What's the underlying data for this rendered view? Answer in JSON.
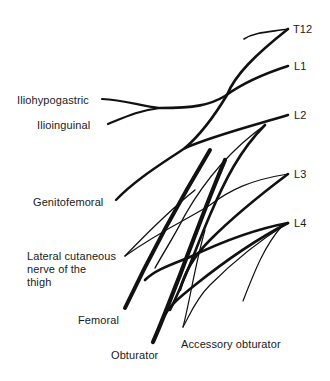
{
  "diagram": {
    "roots": [
      {
        "id": "t12",
        "label": "T12"
      },
      {
        "id": "l1",
        "label": "L1"
      },
      {
        "id": "l2",
        "label": "L2"
      },
      {
        "id": "l3",
        "label": "L3"
      },
      {
        "id": "l4",
        "label": "L4"
      }
    ],
    "branches": [
      {
        "id": "iliohypogastric",
        "label": "Iliohypogastric"
      },
      {
        "id": "ilioinguinal",
        "label": "Ilioinguinal"
      },
      {
        "id": "genitofemoral",
        "label": "Genitofemoral"
      },
      {
        "id": "lateral_cutaneous",
        "label_lines": [
          "Lateral cutaneous",
          "nerve of the",
          "thigh"
        ]
      },
      {
        "id": "femoral",
        "label": "Femoral"
      },
      {
        "id": "obturator",
        "label": "Obturator"
      },
      {
        "id": "accessory_obturator",
        "label": "Accessory obturator"
      }
    ],
    "stroke_color": "#111111",
    "background": "#ffffff"
  }
}
